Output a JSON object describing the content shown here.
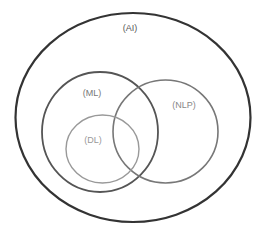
{
  "diagram": {
    "type": "venn",
    "sets": [
      {
        "id": "ai",
        "label": "(AI)",
        "shape": {
          "cx": 133,
          "cy": 117.5,
          "rx": 117.5,
          "ry": 104.5
        },
        "stroke": "#333333",
        "stroke_width": 2.2,
        "label_pos": {
          "x": 130,
          "y": 31
        },
        "label_color": "#555555"
      },
      {
        "id": "ml",
        "label": "(ML)",
        "shape": {
          "cx": 100,
          "cy": 132,
          "rx": 58,
          "ry": 60
        },
        "stroke": "#555555",
        "stroke_width": 1.8,
        "label_pos": {
          "x": 92,
          "y": 96
        },
        "label_color": "#777777"
      },
      {
        "id": "nlp",
        "label": "(NLP)",
        "shape": {
          "cx": 165.5,
          "cy": 131.5,
          "rx": 52.5,
          "ry": 51.5
        },
        "stroke": "#777777",
        "stroke_width": 1.6,
        "label_pos": {
          "x": 184,
          "y": 108
        },
        "label_color": "#888888"
      },
      {
        "id": "dl",
        "label": "(DL)",
        "shape": {
          "cx": 102.5,
          "cy": 149,
          "rx": 36.5,
          "ry": 34
        },
        "stroke": "#999999",
        "stroke_width": 1.4,
        "label_pos": {
          "x": 93,
          "y": 143
        },
        "label_color": "#999999"
      }
    ],
    "relationships": [
      {
        "child": "ml",
        "parent": "ai"
      },
      {
        "child": "nlp",
        "parent": "ai"
      },
      {
        "child": "dl",
        "parent": "ml"
      },
      {
        "overlap": [
          "ml",
          "nlp"
        ]
      },
      {
        "overlap": [
          "dl",
          "nlp"
        ]
      }
    ]
  }
}
